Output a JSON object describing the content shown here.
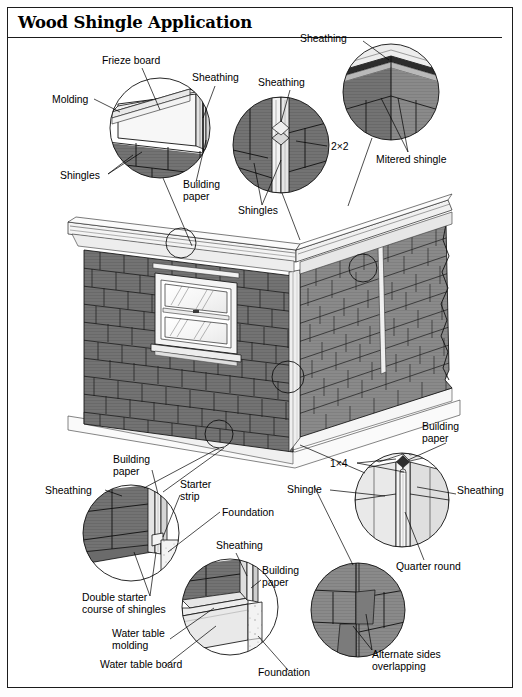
{
  "document": {
    "title": "Wood Shingle Application",
    "type": "technical illustration",
    "subject": "wood shingle siding application details"
  },
  "colors": {
    "ink": "#111111",
    "paper": "#ffffff",
    "shingle_gray": "#858585",
    "shingle_dark": "#6f6f6f",
    "shingle_shadow": "#5a5a5a",
    "trim_white": "#f2f2f2",
    "trim_light": "#e3e3e3",
    "sheathing_gray": "#bdbdbd",
    "foundation": "#f5f5f5"
  },
  "details": [
    {
      "id": "eave-detail",
      "position": "top-left",
      "labels": [
        {
          "text": "Frieze board",
          "x": 102,
          "y": 64,
          "anchor": "start"
        },
        {
          "text": "Molding",
          "x": 58,
          "y": 101,
          "anchor": "start"
        },
        {
          "text": "Sheathing",
          "x": 192,
          "y": 81,
          "anchor": "start"
        },
        {
          "text": "Shingles",
          "x": 74,
          "y": 179,
          "anchor": "start"
        },
        {
          "text": "Building",
          "x": 183,
          "y": 186,
          "anchor": "start"
        },
        {
          "text": "paper",
          "x": 183,
          "y": 198,
          "anchor": "start"
        }
      ]
    },
    {
      "id": "corner-board-detail",
      "position": "top-middle",
      "labels": [
        {
          "text": "Sheathing",
          "x": 265,
          "y": 86,
          "anchor": "start"
        },
        {
          "text": "2×2",
          "x": 330,
          "y": 146,
          "anchor": "start"
        },
        {
          "text": "Shingles",
          "x": 240,
          "y": 210,
          "anchor": "start"
        }
      ]
    },
    {
      "id": "mitered-corner-detail",
      "position": "top-right",
      "labels": [
        {
          "text": "Sheathing",
          "x": 303,
          "y": 42,
          "anchor": "start"
        },
        {
          "text": "Mitered shingle",
          "x": 378,
          "y": 159,
          "anchor": "start"
        }
      ]
    },
    {
      "id": "starter-course-detail",
      "position": "bottom-left",
      "labels": [
        {
          "text": "Building",
          "x": 117,
          "y": 462,
          "anchor": "start"
        },
        {
          "text": "paper",
          "x": 117,
          "y": 474,
          "anchor": "start"
        },
        {
          "text": "Sheathing",
          "x": 53,
          "y": 493,
          "anchor": "start"
        },
        {
          "text": "Starter",
          "x": 182,
          "y": 487,
          "anchor": "start"
        },
        {
          "text": "strip",
          "x": 182,
          "y": 499,
          "anchor": "start"
        },
        {
          "text": "Foundation",
          "x": 223,
          "y": 515,
          "anchor": "start"
        },
        {
          "text": "Double starter",
          "x": 84,
          "y": 600,
          "anchor": "start"
        },
        {
          "text": "course of shingles",
          "x": 84,
          "y": 612,
          "anchor": "start"
        }
      ]
    },
    {
      "id": "water-table-detail",
      "position": "bottom-center",
      "labels": [
        {
          "text": "Sheathing",
          "x": 219,
          "y": 548,
          "anchor": "start"
        },
        {
          "text": "Building",
          "x": 263,
          "y": 572,
          "anchor": "start"
        },
        {
          "text": "paper",
          "x": 263,
          "y": 584,
          "anchor": "start"
        },
        {
          "text": "Water table",
          "x": 116,
          "y": 635,
          "anchor": "start"
        },
        {
          "text": "molding",
          "x": 116,
          "y": 647,
          "anchor": "start"
        },
        {
          "text": "Water table board",
          "x": 104,
          "y": 666,
          "anchor": "start"
        },
        {
          "text": "Foundation",
          "x": 260,
          "y": 674,
          "anchor": "start"
        }
      ]
    },
    {
      "id": "outside-corner-detail",
      "position": "bottom-right-upper",
      "labels": [
        {
          "text": "Building",
          "x": 424,
          "y": 428,
          "anchor": "start"
        },
        {
          "text": "paper",
          "x": 424,
          "y": 440,
          "anchor": "start"
        },
        {
          "text": "1×4",
          "x": 333,
          "y": 466,
          "anchor": "start"
        },
        {
          "text": "Shingle",
          "x": 288,
          "y": 492,
          "anchor": "start"
        },
        {
          "text": "Sheathing",
          "x": 458,
          "y": 492,
          "anchor": "start"
        },
        {
          "text": "Quarter round",
          "x": 399,
          "y": 567,
          "anchor": "start"
        }
      ]
    },
    {
      "id": "alternate-overlap-detail",
      "position": "bottom-right-lower",
      "labels": [
        {
          "text": "Alternate sides",
          "x": 374,
          "y": 656,
          "anchor": "start"
        },
        {
          "text": "overlapping",
          "x": 374,
          "y": 668,
          "anchor": "start"
        }
      ]
    }
  ],
  "main_illustration": {
    "id": "house-corner-view",
    "description": "Corner of a house clad with wood shingles, double-hung window on the left wall, shingled eave above and foundation below",
    "callout_circles": [
      {
        "id": "eave-callout",
        "cx": 181,
        "cy": 243,
        "r": 15
      },
      {
        "id": "mitered-corner-callout",
        "cx": 363,
        "cy": 268,
        "r": 14
      },
      {
        "id": "corner-board-callout",
        "cx": 288,
        "cy": 377,
        "r": 16
      },
      {
        "id": "starter-callout",
        "cx": 219,
        "cy": 434,
        "r": 14
      }
    ]
  },
  "all_label_terms": [
    "Frieze board",
    "Molding",
    "Sheathing",
    "Shingles",
    "Building paper",
    "2×2",
    "Mitered shingle",
    "Starter strip",
    "Foundation",
    "Double starter course of shingles",
    "Water table molding",
    "Water table board",
    "1×4",
    "Shingle",
    "Quarter round",
    "Alternate sides overlapping"
  ]
}
